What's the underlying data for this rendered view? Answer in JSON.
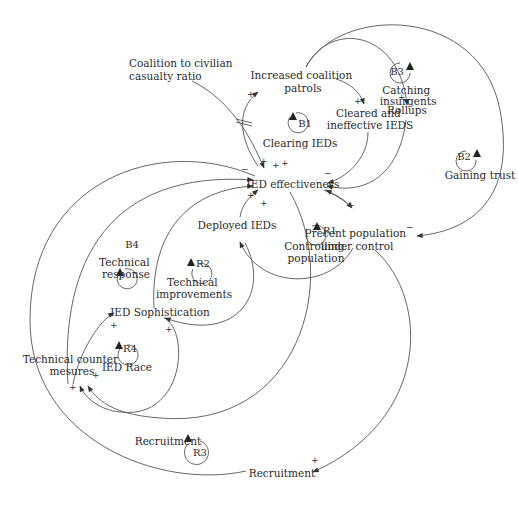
{
  "diagram": {
    "type": "causal-loop-diagram",
    "nodes": {
      "casualty_ratio": [
        "Coalition to civilian",
        "casualty ratio"
      ],
      "patrols": [
        "Increased coalition",
        "patrols"
      ],
      "cleared": [
        "Cleared and",
        "ineffective IEDS"
      ],
      "rollups": "Rollups",
      "ied_effectiveness": "IED effectiveness",
      "deployed_ieds": "Deployed IEDs",
      "population": [
        "Precent population",
        "under control"
      ],
      "sophistication": "IED Sophistication",
      "countermeasures": [
        "Technical counter",
        "mesures"
      ],
      "recruitment_var": "Recruitment"
    },
    "loops": [
      {
        "id": "B1",
        "label": [
          "Clearing IEDs"
        ]
      },
      {
        "id": "B2",
        "label": [
          "Gaining trust"
        ]
      },
      {
        "id": "B3",
        "label": [
          "Catching",
          "insurgents"
        ]
      },
      {
        "id": "B4",
        "label": [
          "Technical",
          "response"
        ]
      },
      {
        "id": "R1",
        "label": [
          "Controlling",
          "population"
        ]
      },
      {
        "id": "R2",
        "label": [
          "Technical",
          "improvements"
        ]
      },
      {
        "id": "R3",
        "label": [
          "Recruitment"
        ]
      },
      {
        "id": "R4",
        "label": [
          "IED Race"
        ]
      }
    ],
    "links": [
      {
        "from": "Increased coalition patrols",
        "to": "Cleared and ineffective IEDS",
        "polarity": "+"
      },
      {
        "from": "Increased coalition patrols",
        "to": "Rollups",
        "polarity": "+"
      },
      {
        "from": "Increased coalition patrols",
        "to": "Precent population under control",
        "polarity": "-"
      },
      {
        "from": "Cleared and ineffective IEDS",
        "to": "IED effectiveness",
        "polarity": "-"
      },
      {
        "from": "Rollups",
        "to": "IED effectiveness",
        "polarity": "-"
      },
      {
        "from": "IED effectiveness",
        "to": "Increased coalition patrols",
        "polarity": "+"
      },
      {
        "from": "Coalition to civilian casualty ratio",
        "to": "IED effectiveness",
        "polarity": "+"
      },
      {
        "from": "IED effectiveness",
        "to": "Precent population under control",
        "polarity": "+"
      },
      {
        "from": "Precent population under control",
        "to": "Deployed IEDs",
        "polarity": "+"
      },
      {
        "from": "Deployed IEDs",
        "to": "IED effectiveness",
        "polarity": "+"
      },
      {
        "from": "IED Sophistication",
        "to": "IED effectiveness",
        "polarity": "+"
      },
      {
        "from": "Technical counter mesures",
        "to": "IED effectiveness",
        "polarity": "-"
      },
      {
        "from": "Technical counter mesures",
        "to": "IED Sophistication",
        "polarity": "+"
      },
      {
        "from": "IED Sophistication",
        "to": "Technical counter mesures",
        "polarity": "+"
      },
      {
        "from": "IED effectiveness",
        "to": "Technical counter mesures",
        "polarity": "+"
      },
      {
        "from": "Deployed IEDs",
        "to": "IED Sophistication",
        "polarity": "+"
      },
      {
        "from": "Precent population under control",
        "to": "Recruitment",
        "polarity": "+"
      },
      {
        "from": "Recruitment",
        "to": "IED effectiveness",
        "polarity": "+"
      }
    ],
    "polarity_marks": {
      "plus": "+",
      "minus": "−"
    }
  }
}
